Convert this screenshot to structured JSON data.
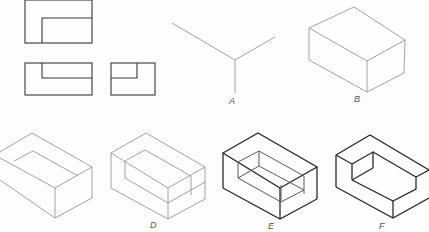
{
  "figure": {
    "views": {
      "orthographic": [
        "top-view",
        "front-view",
        "side-view"
      ],
      "steps": [
        {
          "id": "A",
          "label": "A",
          "description": "isometric axes"
        },
        {
          "id": "B",
          "label": "B",
          "description": "enclosing box"
        },
        {
          "id": "C",
          "label": "",
          "description": "notch outline on top face"
        },
        {
          "id": "D",
          "label": "D",
          "description": "notch outline on front"
        },
        {
          "id": "E",
          "label": "E",
          "description": "notch construction"
        },
        {
          "id": "F",
          "label": "F",
          "description": "finished isometric with darkened lines"
        }
      ]
    },
    "colors": {
      "line_light": "#8a8a8a",
      "line_dark": "#2a2a2a",
      "background": "#fdfdfd"
    }
  }
}
